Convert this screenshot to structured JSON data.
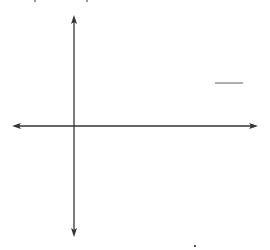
{
  "chart_data": {
    "type": "line",
    "title": "",
    "xlabel": "x",
    "ylabel": "y",
    "function_label": "y = √(2x − 6)",
    "label_parts": {
      "lhs": "y = ",
      "radical": "√",
      "radicand": "2x − 6"
    },
    "grid": true,
    "grid_columns": 16,
    "grid_rows": 14,
    "xlim": [
      -4,
      12
    ],
    "ylim": [
      -7,
      7
    ],
    "x": [
      3,
      3.5,
      4,
      5,
      6,
      7,
      8,
      9,
      10,
      11,
      12
    ],
    "values": [
      0,
      1,
      1.41,
      2,
      2.45,
      2.83,
      3.16,
      3.46,
      3.74,
      4,
      4.24
    ],
    "series": [
      {
        "name": "y = √(2x − 6)",
        "x": [
          3,
          3.5,
          4,
          5,
          6,
          7,
          8,
          9,
          10,
          11,
          12
        ],
        "values": [
          0,
          1,
          1.41,
          2,
          2.45,
          2.83,
          3.16,
          3.46,
          3.74,
          4,
          4.24
        ]
      }
    ],
    "annotations": [
      "curve starts at (3, 0)",
      "arrow continues to the right"
    ]
  },
  "colors": {
    "grid": "#c8c8c8",
    "axis": "#333333",
    "curve": "#333333"
  }
}
